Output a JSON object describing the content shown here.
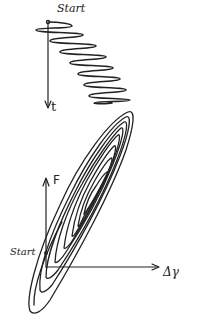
{
  "top_plot": {
    "start_label": "Start",
    "axis_label": "t"
  },
  "bottom_plot": {
    "y_axis_label": "F",
    "x_axis_label": "Δγ",
    "start_label": "Start"
  },
  "colors": {
    "ink": "#222222",
    "background": "#ffffff"
  }
}
